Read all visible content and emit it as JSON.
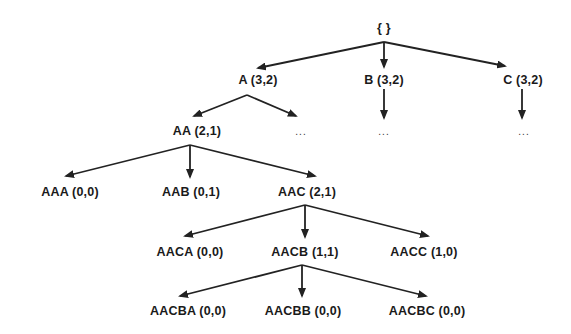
{
  "diagram": {
    "type": "tree",
    "colors": {
      "line": "#222222",
      "text": "#1a1a1a",
      "background": "#ffffff"
    },
    "nodes": {
      "root": {
        "label": "{ }",
        "x": 384,
        "y": 28
      },
      "A": {
        "label": "A (3,2)",
        "x": 258,
        "y": 80
      },
      "B": {
        "label": "B (3,2)",
        "x": 384,
        "y": 80
      },
      "C": {
        "label": "C (3,2)",
        "x": 523,
        "y": 80
      },
      "AA": {
        "label": "AA (2,1)",
        "x": 197,
        "y": 131
      },
      "A_more": {
        "label": "...",
        "x": 301,
        "y": 131
      },
      "B_more": {
        "label": "...",
        "x": 384,
        "y": 131
      },
      "C_more": {
        "label": "...",
        "x": 524,
        "y": 131
      },
      "AAA": {
        "label": "AAA (0,0)",
        "x": 70,
        "y": 192
      },
      "AAB": {
        "label": "AAB (0,1)",
        "x": 191,
        "y": 192
      },
      "AAC": {
        "label": "AAC (2,1)",
        "x": 307,
        "y": 192
      },
      "AACA": {
        "label": "AACA (0,0)",
        "x": 190,
        "y": 252
      },
      "AACB": {
        "label": "AACB (1,1)",
        "x": 305,
        "y": 252
      },
      "AACC": {
        "label": "AACC (1,0)",
        "x": 424,
        "y": 252
      },
      "AACBA": {
        "label": "AACBA (0,0)",
        "x": 188,
        "y": 311
      },
      "AACBB": {
        "label": "AACBB (0,0)",
        "x": 303,
        "y": 311
      },
      "AACBC": {
        "label": "AACBC (0,0)",
        "x": 427,
        "y": 311
      }
    },
    "edges": [
      {
        "from": [
          384,
          42
        ],
        "to": [
          258,
          68
        ],
        "target": "A"
      },
      {
        "from": [
          384,
          42
        ],
        "to": [
          384,
          67
        ],
        "target": "B"
      },
      {
        "from": [
          384,
          42
        ],
        "to": [
          505,
          66
        ],
        "target": "C"
      },
      {
        "from": [
          384,
          89
        ],
        "to": [
          384,
          118
        ],
        "target": "B_more"
      },
      {
        "from": [
          522,
          89
        ],
        "to": [
          522,
          118
        ],
        "target": "C_more"
      },
      {
        "from": [
          247,
          95
        ],
        "to": [
          194,
          116
        ],
        "target": "AA"
      },
      {
        "from": [
          247,
          95
        ],
        "to": [
          296,
          116
        ],
        "target": "A_more"
      },
      {
        "from": [
          190,
          145
        ],
        "to": [
          66,
          176
        ],
        "target": "AAA"
      },
      {
        "from": [
          190,
          145
        ],
        "to": [
          190,
          177
        ],
        "target": "AAB"
      },
      {
        "from": [
          190,
          145
        ],
        "to": [
          315,
          176
        ],
        "target": "AAC"
      },
      {
        "from": [
          305,
          205
        ],
        "to": [
          185,
          236
        ],
        "target": "AACA"
      },
      {
        "from": [
          305,
          205
        ],
        "to": [
          305,
          237
        ],
        "target": "AACB"
      },
      {
        "from": [
          305,
          205
        ],
        "to": [
          428,
          236
        ],
        "target": "AACC"
      },
      {
        "from": [
          302,
          265
        ],
        "to": [
          180,
          296
        ],
        "target": "AACBA"
      },
      {
        "from": [
          302,
          265
        ],
        "to": [
          302,
          296
        ],
        "target": "AACBB"
      },
      {
        "from": [
          302,
          265
        ],
        "to": [
          426,
          296
        ],
        "target": "AACBC"
      }
    ]
  }
}
